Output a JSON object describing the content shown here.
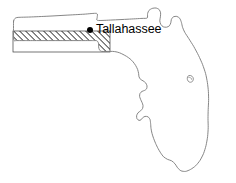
{
  "figure": {
    "name": "florida-state-outline-map",
    "background_color": "#ffffff",
    "width": 236,
    "height": 183
  },
  "map": {
    "state_name": "Florida",
    "outline_color": "#787878",
    "outline_width": 0.9,
    "fill_color": "#ffffff",
    "outline_path": "M 13.5 22.2 L 14.6 19.0 L 16.6 17.6 L 20.6 17.4 L 47.0 16.6 L 62.0 15.4 L 75.5 14.6 L 88.0 14.0 L 97.0 13.6 L 97.6 17.6 L 98.0 20.6 L 113.0 20.2 L 128.0 19.4 L 141.5 18.6 L 147.0 18.2 L 147.4 14.0 L 148.6 10.6 L 151.6 8.6 L 155.6 8.2 L 159.0 9.6 L 160.6 12.6 L 160.4 16.6 L 159.6 20.6 L 160.6 24.6 L 163.0 27.0 L 166.6 27.4 L 169.6 26.0 L 171.0 23.0 L 171.6 19.6 L 173.6 17.0 L 177.0 16.6 L 180.0 18.6 L 181.6 22.6 L 182.6 27.6 L 184.6 32.6 L 188.6 38.6 L 193.6 46.6 L 198.6 55.6 L 202.6 64.6 L 205.6 73.6 L 207.6 82.6 L 208.6 91.6 L 208.6 100.6 L 208.2 109.6 L 208.0 118.6 L 208.2 127.6 L 207.6 136.6 L 206.0 145.6 L 203.6 153.6 L 200.0 160.6 L 195.6 166.0 L 190.6 169.6 L 185.6 171.6 L 181.0 171.0 L 177.6 168.0 L 175.0 164.0 L 171.6 161.0 L 167.6 159.6 L 163.6 157.0 L 160.6 153.0 L 158.0 148.6 L 155.6 143.6 L 153.6 138.6 L 152.0 133.6 L 151.0 128.6 L 150.6 123.6 L 150.0 119.6 L 148.0 117.0 L 145.0 116.6 L 142.6 118.0 L 141.0 120.0 L 139.0 120.6 L 137.0 119.0 L 136.6 116.0 L 138.0 113.0 L 140.6 111.0 L 142.6 108.6 L 143.0 105.6 L 142.0 102.6 L 140.6 99.6 L 139.6 96.6 L 140.0 93.6 L 142.0 91.6 L 144.6 90.6 L 146.6 89.0 L 147.0 86.0 L 145.6 83.0 L 143.0 81.0 L 140.6 79.6 L 139.0 77.0 L 138.6 73.6 L 137.6 69.6 L 135.6 65.6 L 133.0 62.0 L 130.0 59.0 L 126.6 56.6 L 123.0 54.6 L 119.6 53.0 L 116.0 52.0 L 112.6 51.6 L 109.0 51.6 L 105.6 51.6 L 102.0 51.6 L 99.6 50.0 L 98.6 47.0 L 98.6 43.6 L 97.0 41.0 L 94.0 40.6 L 90.6 40.6 L 87.0 40.6 L 83.6 40.6 L 80.0 40.6 L 76.6 40.6 L 73.0 40.6 L 69.6 40.6 L 66.0 40.6 L 62.6 40.6 L 59.0 40.6 L 55.6 40.6 L 52.0 40.6 L 48.6 40.6 L 45.0 40.6 L 41.6 40.6 L 38.0 40.6 L 34.6 40.6 L 31.0 40.6 L 27.6 40.6 L 24.0 40.6 L 20.6 40.6 L 17.0 40.6 L 14.6 40.6 L 13.6 38.0 L 13.5 34.0 L 13.5 28.0 Z",
    "hatched_region": {
      "name": "hatched-band",
      "description": "diagonal hatch band across the panhandle",
      "x": 13,
      "y": 31,
      "width": 97,
      "height": 21,
      "hatch_angle_deg": 45,
      "hatch_spacing_px": 3,
      "hatch_color": "#1a1a1a"
    }
  },
  "city": {
    "label": "Tallahassee",
    "dot_color": "#000000",
    "label_color": "#000000",
    "dot_x": 87,
    "dot_y": 27,
    "label_x": 96,
    "label_y": 23
  }
}
